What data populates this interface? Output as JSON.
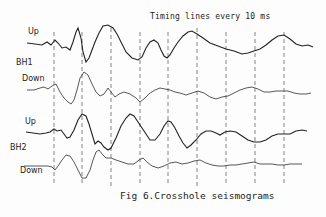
{
  "figure": {
    "caption": "Fig 6.Crosshole seismograms",
    "timing_note": "Timing lines every 10 ms",
    "groups": [
      {
        "name": "BH1",
        "traces": [
          {
            "label": "Up"
          },
          {
            "label": "Down"
          }
        ]
      },
      {
        "name": "BH2",
        "traces": [
          {
            "label": "Up"
          },
          {
            "label": "Down"
          }
        ]
      }
    ],
    "timing_lines_count": 9,
    "timing_interval_ms": 10
  },
  "labels": {
    "bh1": "BH1",
    "bh1_up": "Up",
    "bh1_down": "Down",
    "bh2": "BH2",
    "bh2_up": "Up",
    "bh2_down": "Down"
  },
  "colors": {
    "trace": "#333333",
    "timing_line": "#666666",
    "background": "#fdfdfd"
  }
}
